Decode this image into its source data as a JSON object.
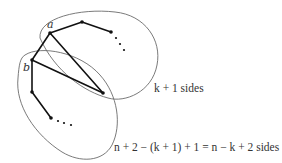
{
  "diagram": {
    "vertex_labels": {
      "a": "a",
      "b": "b"
    },
    "region_labels": {
      "upper": "k + 1 sides",
      "lower": "n + 2 − (k + 1) + 1 = n − k + 2 sides"
    },
    "vertices": [
      {
        "id": "a",
        "x": 50,
        "y": 33
      },
      {
        "id": "v_top",
        "x": 82,
        "y": 22
      },
      {
        "id": "v_right",
        "x": 111,
        "y": 32
      },
      {
        "id": "b",
        "x": 32,
        "y": 60
      },
      {
        "id": "v_left_low",
        "x": 32,
        "y": 92
      },
      {
        "id": "v_bottom",
        "x": 51,
        "y": 118
      },
      {
        "id": "v_cross",
        "x": 103,
        "y": 93
      }
    ],
    "edges": [
      [
        "a",
        "v_top"
      ],
      [
        "v_top",
        "v_right"
      ],
      [
        "a",
        "b"
      ],
      [
        "a",
        "v_cross"
      ],
      [
        "b",
        "v_cross"
      ],
      [
        "b",
        "v_left_low"
      ],
      [
        "v_left_low",
        "v_bottom"
      ]
    ],
    "colors": {
      "edge": "#111111",
      "region_outline": "#6b6b6b",
      "text": "#333333"
    }
  }
}
